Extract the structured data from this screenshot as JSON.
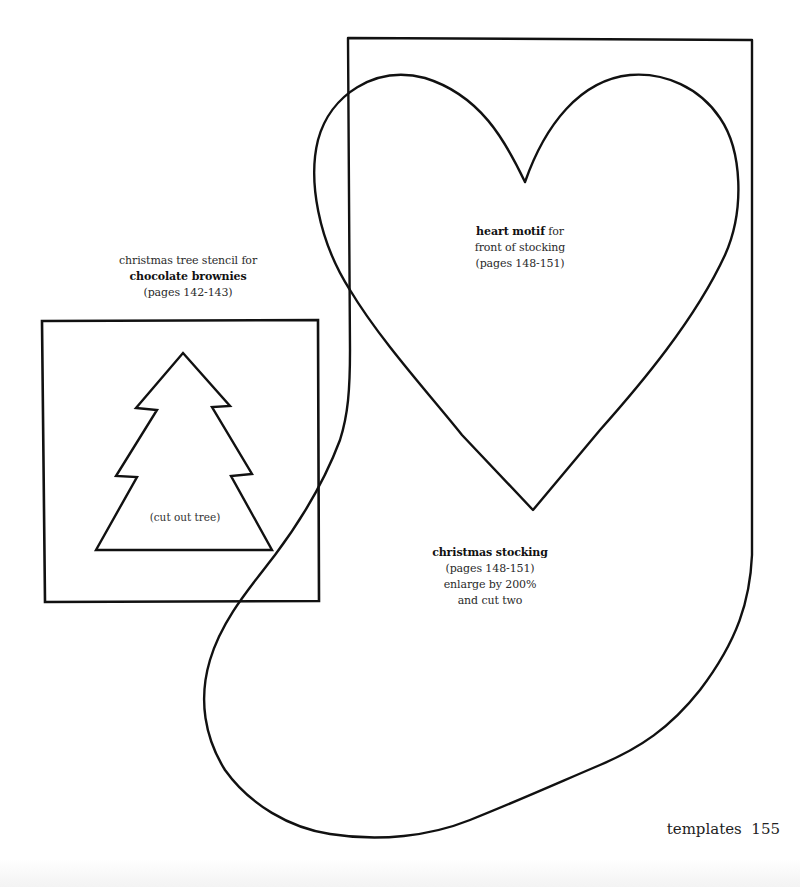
{
  "tree_template": {
    "caption_line1": "christmas tree stencil for",
    "caption_title": "chocolate brownies",
    "caption_pages": "(pages 142-143)",
    "cut_label": "(cut out tree)"
  },
  "heart_template": {
    "caption_title": "heart motif",
    "caption_suffix": " for",
    "caption_line2": "front of stocking",
    "caption_pages": "(pages 148-151)"
  },
  "stocking_template": {
    "caption_title": "christmas stocking",
    "caption_pages": "(pages 148-151)",
    "caption_enlarge": "enlarge by 200%",
    "caption_cut": "and cut two"
  },
  "footer": {
    "section": "templates",
    "page_number": "155"
  },
  "colors": {
    "ink": "#111111",
    "paper": "#ffffff"
  }
}
